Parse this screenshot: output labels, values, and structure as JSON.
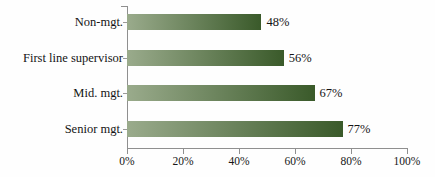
{
  "chart_data": {
    "type": "bar",
    "orientation": "horizontal",
    "title": "",
    "subtitle": "",
    "xlabel": "",
    "ylabel": "",
    "categories": [
      "Non-mgt.",
      "First line supervisor",
      "Mid. mgt.",
      "Senior mgt."
    ],
    "values": [
      48,
      56,
      67,
      77
    ],
    "value_labels": [
      "48%",
      "56%",
      "67%",
      "77%"
    ],
    "xlim": [
      0,
      100
    ],
    "xticks": [
      0,
      20,
      40,
      60,
      80,
      100
    ],
    "xtick_labels": [
      "0%",
      "20%",
      "40%",
      "60%",
      "80%",
      "100%"
    ],
    "grid": false,
    "legend": false,
    "legend_position": "none",
    "series": [
      {
        "name": "",
        "values": [
          48,
          56,
          67,
          77
        ]
      }
    ],
    "colors": {
      "bar_gradient_start": "#9aab8c",
      "bar_gradient_end": "#3a5a2a",
      "axis": "#8f8f8f",
      "text": "#141414",
      "background": "#fefefe"
    }
  }
}
